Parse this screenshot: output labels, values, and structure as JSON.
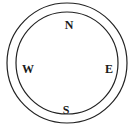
{
  "diagram": {
    "type": "compass",
    "directions": {
      "north": "N",
      "east": "E",
      "south": "S",
      "west": "W"
    },
    "colors": {
      "stroke": "#222222",
      "text": "#1a1a1a",
      "background": "#ffffff"
    }
  }
}
